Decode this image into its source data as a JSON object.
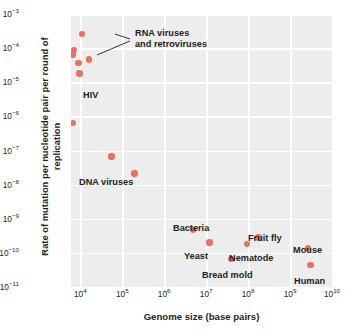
{
  "chart_data": {
    "type": "scatter",
    "title": "",
    "xlabel": "Genome size (base pairs)",
    "ylabel": "Rate of mutation per nucleotide pair per round of replication",
    "xscale": "log",
    "yscale": "log",
    "xlim": [
      6000,
      10000000000
    ],
    "ylim": [
      1e-11,
      0.001
    ],
    "grid": true,
    "legend": "none",
    "xticks": [
      "10^4",
      "10^5",
      "10^6",
      "10^7",
      "10^8",
      "10^9",
      "10^10"
    ],
    "xtick_values": [
      10000,
      100000,
      1000000,
      10000000,
      100000000,
      1000000000,
      10000000000
    ],
    "yticks": [
      "10^-3",
      "10^-4",
      "10^-5",
      "10^-6",
      "10^-7",
      "10^-8",
      "10^-9",
      "10^-10",
      "10^-11"
    ],
    "ytick_values": [
      0.001,
      0.0001,
      1e-05,
      1e-06,
      1e-07,
      1e-08,
      1e-09,
      1e-10,
      1e-11
    ],
    "marker_color": "#e8705f",
    "plot_background": "#ededed",
    "gridline_color": "#ffffff",
    "points": [
      {
        "label": "RNA virus",
        "x": 11000,
        "y": 0.00026
      },
      {
        "label": "RNA virus",
        "x": 7000,
        "y": 9e-05
      },
      {
        "label": "RNA virus",
        "x": 6600,
        "y": 7e-05
      },
      {
        "label": "RNA virus",
        "x": 6800,
        "y": 6.2e-05
      },
      {
        "label": "RNA virus",
        "x": 16000,
        "y": 4.6e-05
      },
      {
        "label": "RNA virus",
        "x": 9000,
        "y": 3.6e-05
      },
      {
        "label": "HIV",
        "x": 9500,
        "y": 1.8e-05
      },
      {
        "label": "DNA virus",
        "x": 6800,
        "y": 6.5e-07
      },
      {
        "label": "DNA virus",
        "x": 55000,
        "y": 6.6e-08
      },
      {
        "label": "DNA virus",
        "x": 195000,
        "y": 2.1e-08
      },
      {
        "label": "Bacteria",
        "x": 4800000,
        "y": 4.6e-10
      },
      {
        "label": "Yeast",
        "x": 12000000,
        "y": 2e-10
      },
      {
        "label": "Bread mold",
        "x": 40000000,
        "y": 6.5e-11
      },
      {
        "label": "Nematode",
        "x": 95000000,
        "y": 1.8e-10
      },
      {
        "label": "Fruit fly",
        "x": 175000000,
        "y": 2.8e-10
      },
      {
        "label": "Mouse",
        "x": 2700000000,
        "y": 1.4e-10
      },
      {
        "label": "Human",
        "x": 3100000000,
        "y": 4.5e-11
      }
    ],
    "annotations": [
      {
        "name": "rna-viruses",
        "text": "RNA viruses\nand retroviruses"
      },
      {
        "name": "hiv",
        "text": "HIV"
      },
      {
        "name": "dna-viruses",
        "text": "DNA viruses"
      },
      {
        "name": "bacteria",
        "text": "Bacteria"
      },
      {
        "name": "yeast",
        "text": "Yeast"
      },
      {
        "name": "bread-mold",
        "text": "Bread mold"
      },
      {
        "name": "nematode",
        "text": "Nematode"
      },
      {
        "name": "fruit-fly",
        "text": "Fruit fly"
      },
      {
        "name": "mouse",
        "text": "Mouse"
      },
      {
        "name": "human",
        "text": "Human"
      }
    ]
  },
  "axes": {
    "x_title": "Genome size (base pairs)",
    "y_title": "Rate of mutation per nucleotide pair per round of replication",
    "x_tick_labels": [
      {
        "mantissa": "10",
        "exp": "4"
      },
      {
        "mantissa": "10",
        "exp": "5"
      },
      {
        "mantissa": "10",
        "exp": "6"
      },
      {
        "mantissa": "10",
        "exp": "7"
      },
      {
        "mantissa": "10",
        "exp": "8"
      },
      {
        "mantissa": "10",
        "exp": "9"
      },
      {
        "mantissa": "10",
        "exp": "10"
      }
    ],
    "y_tick_labels": [
      {
        "mantissa": "10",
        "exp": "−3"
      },
      {
        "mantissa": "10",
        "exp": "−4"
      },
      {
        "mantissa": "10",
        "exp": "−5"
      },
      {
        "mantissa": "10",
        "exp": "−6"
      },
      {
        "mantissa": "10",
        "exp": "−7"
      },
      {
        "mantissa": "10",
        "exp": "−8"
      },
      {
        "mantissa": "10",
        "exp": "−9"
      },
      {
        "mantissa": "10",
        "exp": "−10"
      },
      {
        "mantissa": "10",
        "exp": "−11"
      }
    ]
  },
  "labels": {
    "rna_line1": "RNA viruses",
    "rna_line2": "and retroviruses",
    "hiv": "HIV",
    "dna_viruses": "DNA viruses",
    "bacteria": "Bacteria",
    "yeast": "Yeast",
    "bread_mold": "Bread mold",
    "nematode": "Nematode",
    "fruit_fly": "Fruit fly",
    "mouse": "Mouse",
    "human": "Human"
  }
}
